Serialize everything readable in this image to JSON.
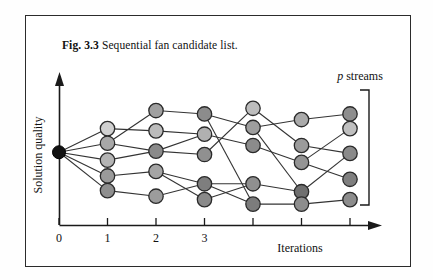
{
  "figure": {
    "caption_label": "Fig. 3.3",
    "caption_text": "Sequential fan candidate list."
  },
  "chart_data": {
    "type": "scatter",
    "title": "Sequential fan candidate list.",
    "xlabel": "Iterations",
    "ylabel": "Solution quality",
    "grid": false,
    "legend": "none",
    "annotations": [
      {
        "name": "p-streams",
        "text_italic": "p",
        "text": " streams"
      }
    ],
    "xlim": [
      0,
      7
    ],
    "ylim": [
      0,
      10
    ],
    "xticks": [
      0,
      1,
      2,
      3,
      4,
      5,
      6
    ],
    "xticklabels": [
      "0",
      "1",
      "2",
      "3",
      "",
      "",
      ""
    ],
    "p_streams": 5,
    "root": {
      "id": "root",
      "x": 0,
      "y": 5.15,
      "shade": "#111111"
    },
    "nodes": [
      {
        "id": "n1-1",
        "x": 1,
        "y": 6.2,
        "shade": "#d0d0d0"
      },
      {
        "id": "n1-2",
        "x": 1,
        "y": 5.55,
        "shade": "#a8a8a8"
      },
      {
        "id": "n1-3",
        "x": 1,
        "y": 4.8,
        "shade": "#b4b4b4"
      },
      {
        "id": "n1-4",
        "x": 1,
        "y": 4.1,
        "shade": "#9a9a9a"
      },
      {
        "id": "n1-5",
        "x": 1,
        "y": 3.45,
        "shade": "#8f8f8f"
      },
      {
        "id": "n2-1",
        "x": 2,
        "y": 7.0,
        "shade": "#a0a0a0"
      },
      {
        "id": "n2-2",
        "x": 2,
        "y": 6.1,
        "shade": "#bcbcbc"
      },
      {
        "id": "n2-3",
        "x": 2,
        "y": 5.2,
        "shade": "#8a8a8a"
      },
      {
        "id": "n2-4",
        "x": 2,
        "y": 4.3,
        "shade": "#a5a5a5"
      },
      {
        "id": "n2-5",
        "x": 2,
        "y": 3.2,
        "shade": "#9c9c9c"
      },
      {
        "id": "n3-1",
        "x": 3,
        "y": 6.85,
        "shade": "#8c8c8c"
      },
      {
        "id": "n3-2",
        "x": 3,
        "y": 5.95,
        "shade": "#b0b0b0"
      },
      {
        "id": "n3-3",
        "x": 3,
        "y": 5.05,
        "shade": "#909090"
      },
      {
        "id": "n3-4",
        "x": 3,
        "y": 3.75,
        "shade": "#7e7e7e"
      },
      {
        "id": "n3-5",
        "x": 3,
        "y": 3.05,
        "shade": "#8a8a8a"
      },
      {
        "id": "n4-1",
        "x": 4,
        "y": 7.1,
        "shade": "#bdbdbd"
      },
      {
        "id": "n4-2",
        "x": 4,
        "y": 6.25,
        "shade": "#9e9e9e"
      },
      {
        "id": "n4-3",
        "x": 4,
        "y": 5.45,
        "shade": "#8b8b8b"
      },
      {
        "id": "n4-4",
        "x": 4,
        "y": 3.75,
        "shade": "#8f8f8f"
      },
      {
        "id": "n4-5",
        "x": 4,
        "y": 2.85,
        "shade": "#7c7c7c"
      },
      {
        "id": "n5-1",
        "x": 5,
        "y": 6.6,
        "shade": "#aaaaaa"
      },
      {
        "id": "n5-2",
        "x": 5,
        "y": 5.45,
        "shade": "#9b9b9b"
      },
      {
        "id": "n5-3",
        "x": 5,
        "y": 4.7,
        "shade": "#949494"
      },
      {
        "id": "n5-4",
        "x": 5,
        "y": 3.4,
        "shade": "#6f6f6f"
      },
      {
        "id": "n5-5",
        "x": 5,
        "y": 2.85,
        "shade": "#8d8d8d"
      },
      {
        "id": "n6-1",
        "x": 6,
        "y": 6.85,
        "shade": "#8e8e8e"
      },
      {
        "id": "n6-2",
        "x": 6,
        "y": 6.2,
        "shade": "#bfbfbf"
      },
      {
        "id": "n6-3",
        "x": 6,
        "y": 5.1,
        "shade": "#8a8a8a"
      },
      {
        "id": "n6-4",
        "x": 6,
        "y": 3.95,
        "shade": "#7f7f7f"
      },
      {
        "id": "n6-5",
        "x": 6,
        "y": 3.05,
        "shade": "#8c8c8c"
      }
    ],
    "edges": [
      [
        "root",
        "n1-1"
      ],
      [
        "root",
        "n1-2"
      ],
      [
        "root",
        "n1-3"
      ],
      [
        "root",
        "n1-4"
      ],
      [
        "root",
        "n1-5"
      ],
      [
        "n1-1",
        "n2-2"
      ],
      [
        "n1-2",
        "n2-1"
      ],
      [
        "n1-2",
        "n2-3"
      ],
      [
        "n1-3",
        "n2-3"
      ],
      [
        "n1-4",
        "n2-4"
      ],
      [
        "n1-5",
        "n2-5"
      ],
      [
        "n2-1",
        "n3-1"
      ],
      [
        "n2-2",
        "n3-2"
      ],
      [
        "n2-3",
        "n3-2"
      ],
      [
        "n2-3",
        "n3-3"
      ],
      [
        "n2-4",
        "n3-4"
      ],
      [
        "n2-5",
        "n3-4"
      ],
      [
        "n2-4",
        "n3-5"
      ],
      [
        "n3-1",
        "n4-2"
      ],
      [
        "n3-2",
        "n4-3"
      ],
      [
        "n3-1",
        "n4-5"
      ],
      [
        "n3-3",
        "n4-1"
      ],
      [
        "n3-4",
        "n4-4"
      ],
      [
        "n3-5",
        "n4-4"
      ],
      [
        "n3-4",
        "n4-5"
      ],
      [
        "n4-1",
        "n5-2"
      ],
      [
        "n4-2",
        "n5-1"
      ],
      [
        "n4-3",
        "n5-3"
      ],
      [
        "n4-2",
        "n5-4"
      ],
      [
        "n4-4",
        "n5-4"
      ],
      [
        "n4-5",
        "n5-5"
      ],
      [
        "n5-1",
        "n6-1"
      ],
      [
        "n5-2",
        "n6-3"
      ],
      [
        "n5-3",
        "n6-2"
      ],
      [
        "n5-3",
        "n6-4"
      ],
      [
        "n5-4",
        "n6-3"
      ],
      [
        "n5-5",
        "n6-5"
      ]
    ]
  }
}
